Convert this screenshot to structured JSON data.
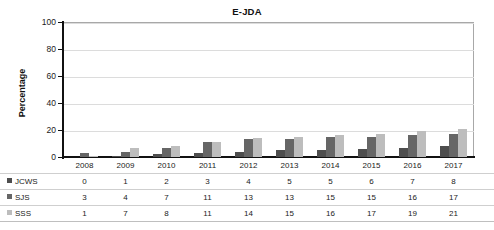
{
  "chart_data": {
    "type": "bar",
    "title": "E-JDA",
    "xlabel": "",
    "ylabel": "Percentage",
    "ylim": [
      0,
      100
    ],
    "yticks": [
      0,
      20,
      40,
      60,
      80,
      100
    ],
    "grid": true,
    "legend_position": "table-left",
    "categories": [
      "2008",
      "2009",
      "2010",
      "2011",
      "2012",
      "2013",
      "2014",
      "2015",
      "2016",
      "2017"
    ],
    "series": [
      {
        "name": "JCWS",
        "color": "#4e4e4e",
        "values": [
          0,
          1,
          2,
          3,
          4,
          5,
          5,
          6,
          7,
          8
        ]
      },
      {
        "name": "SJS",
        "color": "#666666",
        "values": [
          3,
          4,
          7,
          11,
          13,
          13,
          15,
          15,
          16,
          17
        ]
      },
      {
        "name": "SSS",
        "color": "#bdbdbd",
        "values": [
          1,
          7,
          8,
          11,
          14,
          15,
          16,
          17,
          19,
          21
        ]
      }
    ]
  },
  "table": {
    "header": [
      "2008",
      "2009",
      "2010",
      "2011",
      "2012",
      "2013",
      "2014",
      "2015",
      "2016",
      "2017"
    ],
    "rows": [
      {
        "label": "JCWS",
        "values": [
          "0",
          "1",
          "2",
          "3",
          "4",
          "5",
          "5",
          "6",
          "7",
          "8"
        ]
      },
      {
        "label": "SJS",
        "values": [
          "3",
          "4",
          "7",
          "11",
          "13",
          "13",
          "15",
          "15",
          "16",
          "17"
        ]
      },
      {
        "label": "SSS",
        "values": [
          "1",
          "7",
          "8",
          "11",
          "14",
          "15",
          "16",
          "17",
          "19",
          "21"
        ]
      }
    ]
  }
}
